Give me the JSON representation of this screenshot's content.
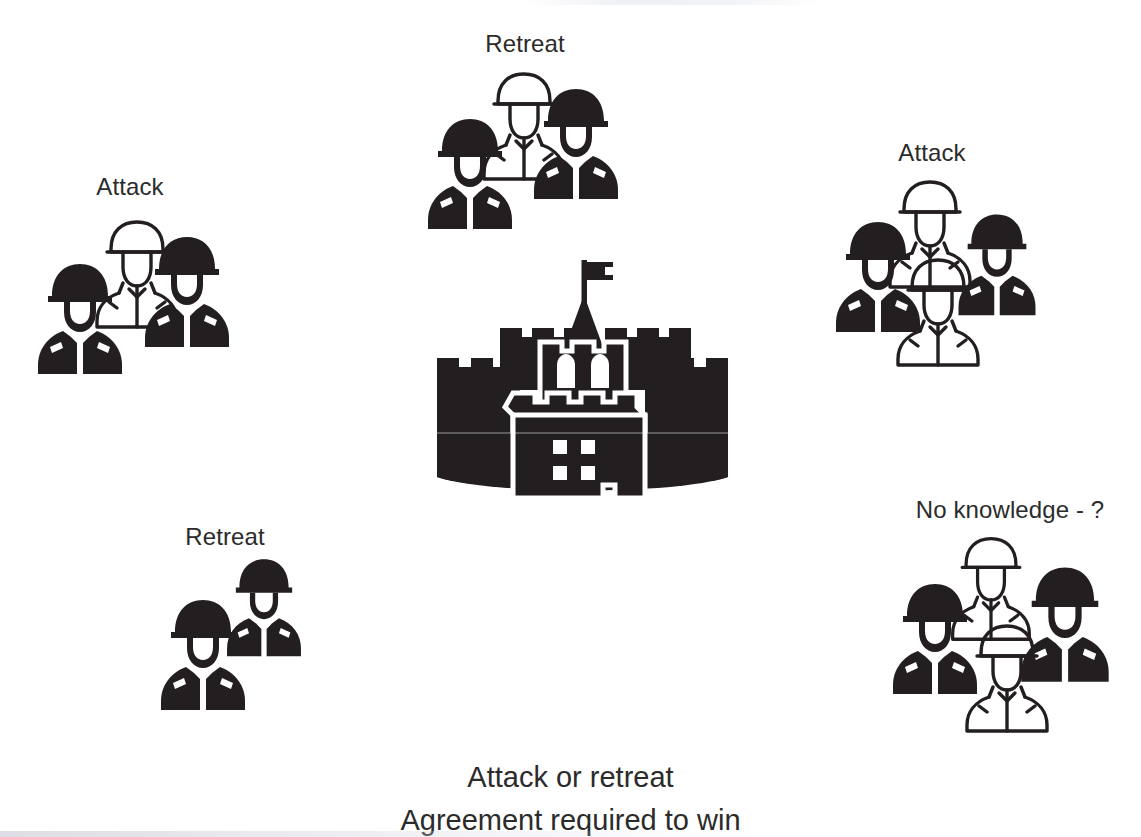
{
  "diagram": {
    "title_caption_lines": [
      "Attack or retreat",
      "Agreement required to win"
    ],
    "center": {
      "icon": "castle-fortress-icon"
    },
    "groups": [
      {
        "id": "left-attack",
        "label": "Attack",
        "soldier_count": 3,
        "soldiers": [
          "filled",
          "outline",
          "filled"
        ]
      },
      {
        "id": "top-retreat",
        "label": "Retreat",
        "soldier_count": 3,
        "soldiers": [
          "filled",
          "outline",
          "filled"
        ]
      },
      {
        "id": "right-attack",
        "label": "Attack",
        "soldier_count": 4,
        "soldiers": [
          "filled",
          "outline",
          "filled",
          "outline"
        ]
      },
      {
        "id": "bottom-left-retreat",
        "label": "Retreat",
        "soldier_count": 2,
        "soldiers": [
          "filled",
          "filled"
        ]
      },
      {
        "id": "bottom-right-unknown",
        "label": "No knowledge - ?",
        "soldier_count": 4,
        "soldiers": [
          "filled",
          "outline",
          "filled",
          "outline"
        ]
      }
    ],
    "colors": {
      "ink": "#231f20",
      "text": "#2b2b2b",
      "background": "#ffffff"
    }
  }
}
